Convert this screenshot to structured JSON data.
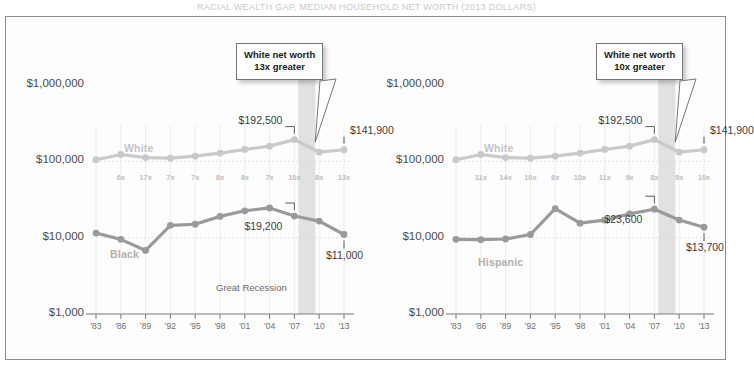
{
  "title_strip": "RACIAL WEALTH GAP, MEDIAN HOUSEHOLD NET WORTH (2013 DOLLARS)",
  "colors": {
    "white_line": "#c9c9c9",
    "minority_line": "#9a9a9a",
    "recession_band": "#dcdcdc",
    "frame": "#8d8d8d",
    "axis": "#7a7a7a",
    "gridline": "#d8d8d8",
    "value_text": "#3c3c3c",
    "multiplier_text": "#bdbdbd"
  },
  "axis": {
    "y_ticks": [
      "$1,000,000",
      "$100,000",
      "$10,000",
      "$1,000"
    ],
    "y_values": [
      1000000,
      100000,
      10000,
      1000
    ],
    "x_ticks": [
      "'83",
      "'86",
      "'89",
      "'92",
      "'95",
      "'98",
      "'01",
      "'04",
      "'07",
      "'10",
      "'13"
    ],
    "scale": "log"
  },
  "recession": {
    "label": "Great Recession",
    "start": "'07",
    "end": "'09"
  },
  "chart_data": [
    {
      "type": "line",
      "title": "White vs. Black median household net worth",
      "xlabel": "",
      "ylabel": "Median household net worth",
      "scale": "log",
      "ylim": [
        1000,
        1000000
      ],
      "grid": true,
      "legend_position": "inline",
      "x": [
        "'83",
        "'86",
        "'89",
        "'92",
        "'95",
        "'98",
        "'01",
        "'04",
        "'07",
        "'10",
        "'13"
      ],
      "series": [
        {
          "name": "White",
          "color": "#c9c9c9",
          "values": [
            105000,
            123000,
            112000,
            110000,
            117000,
            128000,
            143000,
            158000,
            192500,
            132000,
            141900
          ]
        },
        {
          "name": "Black",
          "color": "#9a9a9a",
          "values": [
            11500,
            9500,
            6800,
            14500,
            15000,
            19000,
            22500,
            24500,
            19200,
            16500,
            11000
          ]
        }
      ],
      "multipliers": [
        "6x",
        "17x",
        "7x",
        "7x",
        "8x",
        "8x",
        "7x",
        "10x",
        "8x",
        "13x"
      ],
      "point_labels": [
        {
          "text": "$192,500",
          "series": "White",
          "x": "'07"
        },
        {
          "text": "$141,900",
          "series": "White",
          "x": "'13"
        },
        {
          "text": "$19,200",
          "series": "Black",
          "x": "'07"
        },
        {
          "text": "$11,000",
          "series": "Black",
          "x": "'13"
        }
      ],
      "callout": {
        "line1": "White net worth",
        "line2": "13x greater",
        "anchor_x": "'10"
      }
    },
    {
      "type": "line",
      "title": "White vs. Hispanic median household net worth",
      "xlabel": "",
      "ylabel": "Median household net worth",
      "scale": "log",
      "ylim": [
        1000,
        1000000
      ],
      "grid": true,
      "legend_position": "inline",
      "x": [
        "'83",
        "'86",
        "'89",
        "'92",
        "'95",
        "'98",
        "'01",
        "'04",
        "'07",
        "'10",
        "'13"
      ],
      "series": [
        {
          "name": "White",
          "color": "#c9c9c9",
          "values": [
            105000,
            123000,
            112000,
            110000,
            117000,
            128000,
            143000,
            158000,
            192500,
            132000,
            141900
          ]
        },
        {
          "name": "Hispanic",
          "color": "#9a9a9a",
          "values": [
            9500,
            9400,
            9600,
            11000,
            24000,
            15500,
            17000,
            20500,
            23600,
            17000,
            13700
          ]
        }
      ],
      "multipliers": [
        "11x",
        "14x",
        "10x",
        "8x",
        "10x",
        "11x",
        "9x",
        "8x",
        "9x",
        "10x"
      ],
      "point_labels": [
        {
          "text": "$192,500",
          "series": "White",
          "x": "'07"
        },
        {
          "text": "$141,900",
          "series": "White",
          "x": "'13"
        },
        {
          "text": "$23,600",
          "series": "Hispanic",
          "x": "'07"
        },
        {
          "text": "$13,700",
          "series": "Hispanic",
          "x": "'13"
        }
      ],
      "callout": {
        "line1": "White net worth",
        "line2": "10x greater",
        "anchor_x": "'10"
      }
    }
  ]
}
